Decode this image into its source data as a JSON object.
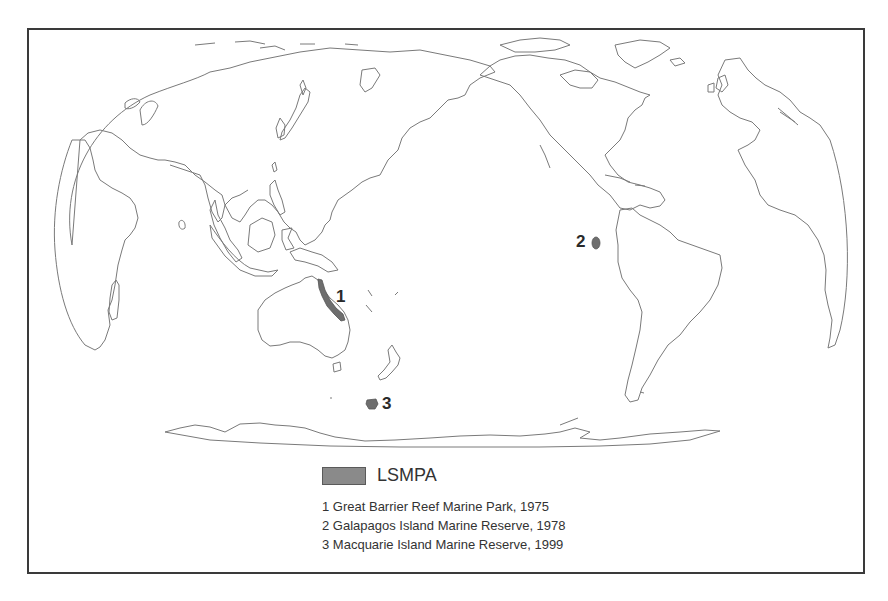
{
  "map": {
    "projection": "Pacific-centered world map (Robinson-like)",
    "feature_color": "#6e6e6e",
    "coastline_color": "#7a7a7a",
    "markers": [
      {
        "id": "1",
        "label": "1"
      },
      {
        "id": "2",
        "label": "2"
      },
      {
        "id": "3",
        "label": "3"
      }
    ]
  },
  "legend": {
    "swatch_color": "#8a8a8a",
    "title": "LSMPA",
    "items": [
      {
        "number": "1",
        "text": "1 Great Barrier Reef Marine Park, 1975"
      },
      {
        "number": "2",
        "text": "2 Galapagos Island Marine Reserve, 1978"
      },
      {
        "number": "3",
        "text": "3 Macquarie Island Marine Reserve, 1999"
      }
    ]
  }
}
